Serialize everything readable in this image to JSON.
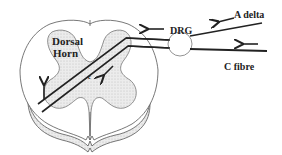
{
  "diagram": {
    "labels": {
      "dorsal_line1": "Dorsal",
      "dorsal_line2": "Horn",
      "drg": "DRG",
      "a_delta": "A delta",
      "c_fibre": "C fibre",
      "synapse": "c"
    },
    "colors": {
      "ink": "#222222",
      "grey_matter": "#e4e4e4",
      "white_matter": "#ffffff",
      "outline": "#555555"
    }
  }
}
